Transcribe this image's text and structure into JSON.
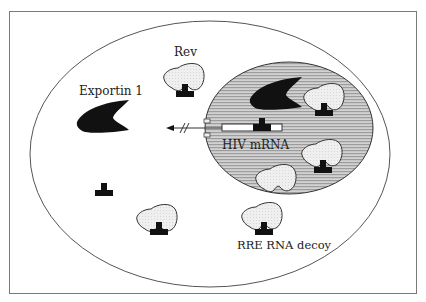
{
  "diagram": {
    "labels": {
      "rev": "Rev",
      "exportin": "Exportin 1",
      "hiv_mrna": "HIV mRNA",
      "rre_decoy": "RRE RNA decoy"
    },
    "colors": {
      "frame": "#7a7a7a",
      "membrane": "#555555",
      "nucleus_fill": "#c8c8c8",
      "nucleus_stripe": "#9a9a9a",
      "protein_fill": "#ececec",
      "protein_outline": "#333333",
      "rre_black": "#111111",
      "mrna_fill": "#ffffff"
    },
    "components": {
      "cell": {
        "cx": 210,
        "cy": 154,
        "rx": 180,
        "ry": 133
      },
      "nucleus": {
        "cx": 289,
        "cy": 128,
        "rx": 84,
        "ry": 66
      },
      "cytoplasm_rev_proteins": [
        {
          "x": 160,
          "y": 65
        },
        {
          "x": 135,
          "y": 203
        },
        {
          "x": 240,
          "y": 201
        }
      ],
      "nuclear_rev_proteins": [
        {
          "x": 302,
          "y": 85
        },
        {
          "x": 300,
          "y": 140
        },
        {
          "x": 254,
          "y": 162
        }
      ],
      "free_decoy": {
        "x": 95,
        "y": 183
      },
      "exportin_cytoplasm": {
        "x": 78,
        "y": 100
      },
      "exportin_nucleus": {
        "x": 250,
        "y": 77
      },
      "export_arrow": {
        "from_x": 210,
        "to_x": 168,
        "y": 130
      }
    }
  }
}
